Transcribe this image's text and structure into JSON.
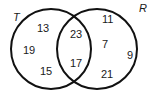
{
  "diagram": {
    "type": "venn",
    "sets": [
      {
        "name": "T",
        "label": "T",
        "only_values": [
          "13",
          "19",
          "15"
        ]
      },
      {
        "name": "R",
        "label": "R",
        "only_values": [
          "11",
          "7",
          "9",
          "21"
        ]
      }
    ],
    "intersection_values": [
      "23",
      "17"
    ],
    "texts": {
      "label_t": "T",
      "label_r": "R",
      "t_only_1": "13",
      "t_only_2": "19",
      "t_only_3": "15",
      "both_1": "23",
      "both_2": "17",
      "r_only_1": "11",
      "r_only_2": "7",
      "r_only_3": "9",
      "r_only_4": "21"
    },
    "colors": {
      "stroke": "#111111",
      "text": "#1a1a1a",
      "background": "#ffffff"
    }
  }
}
